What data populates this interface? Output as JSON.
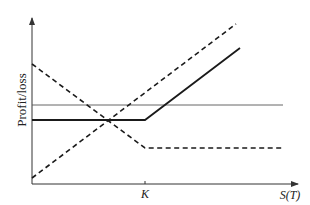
{
  "diagram": {
    "y_label": "Profit/loss",
    "x_label": "S(T)",
    "strike_label": "K",
    "colors": {
      "line": "#1a1a1a",
      "axis": "#333333",
      "thin": "#555555"
    },
    "lines": [
      {
        "name": "thin-horizontal-line",
        "style": "solid-thin",
        "points": [
          [
            32,
            105
          ],
          [
            283,
            105
          ]
        ]
      },
      {
        "name": "thick-payoff-line",
        "style": "solid-thick",
        "points": [
          [
            32,
            120
          ],
          [
            145,
            120
          ],
          [
            240,
            48
          ]
        ]
      },
      {
        "name": "dashed-descending-line",
        "style": "dashed",
        "points": [
          [
            32,
            64
          ],
          [
            145,
            148
          ],
          [
            283,
            148
          ]
        ]
      },
      {
        "name": "dashed-ascending-line",
        "style": "dashed",
        "points": [
          [
            32,
            178
          ],
          [
            236,
            24
          ]
        ]
      }
    ]
  }
}
